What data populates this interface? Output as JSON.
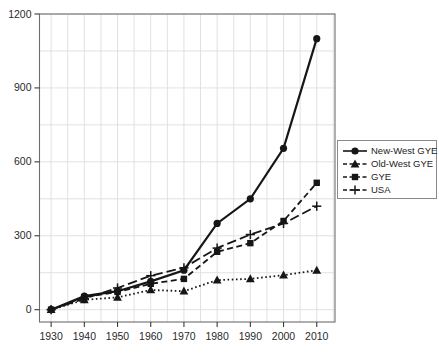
{
  "chart_data": {
    "type": "line",
    "title": "",
    "xlabel": "",
    "ylabel": "",
    "x": [
      1930,
      1940,
      1950,
      1960,
      1970,
      1980,
      1990,
      2000,
      2010
    ],
    "series": [
      {
        "name": "New-West GYE",
        "marker": "circle",
        "linestyle": "solid",
        "values": [
          0,
          55,
          75,
          115,
          160,
          350,
          450,
          655,
          1100
        ]
      },
      {
        "name": "Old-West GYE",
        "marker": "triangle",
        "linestyle": "dotted",
        "values": [
          0,
          40,
          50,
          80,
          75,
          120,
          125,
          140,
          160
        ]
      },
      {
        "name": "GYE",
        "marker": "square",
        "linestyle": "dashed",
        "values": [
          0,
          50,
          72,
          105,
          125,
          235,
          270,
          360,
          515
        ]
      },
      {
        "name": "USA",
        "marker": "plus",
        "linestyle": "longdash",
        "values": [
          0,
          45,
          88,
          138,
          170,
          250,
          305,
          350,
          420
        ]
      }
    ],
    "xticks": [
      1930,
      1940,
      1950,
      1960,
      1970,
      1980,
      1990,
      2000,
      2010
    ],
    "yticks": [
      0,
      300,
      600,
      900,
      1200
    ],
    "xlim": [
      1926.5,
      2015.5
    ],
    "ylim": [
      -50,
      1200
    ],
    "grid": {
      "on": true,
      "x_interval_years": 5,
      "y_interval_units": 150
    },
    "legend_position": "right-outside",
    "colors": {
      "series": "#161616",
      "grid": "#dedede",
      "axis_box": "#6e6e6e",
      "tick_text": "#2a2a2a",
      "background": "#ffffff",
      "legend_border": "#8a8a8a"
    }
  }
}
